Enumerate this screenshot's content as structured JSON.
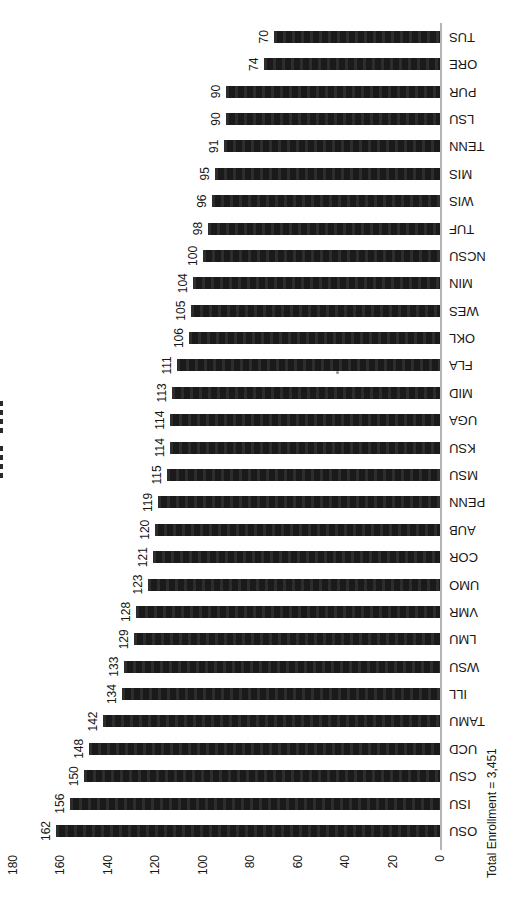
{
  "chart_data": {
    "type": "bar",
    "title": "",
    "orientation": "vertical columns; whole chart displayed rotated 90deg counter-clockwise (scanned sideways page)",
    "categories": [
      "OSU",
      "ISU",
      "CSU",
      "UCD",
      "TAMU",
      "ILL",
      "WSU",
      "LMU",
      "VMR",
      "UMO",
      "COR",
      "AUB",
      "PENN",
      "MSU",
      "KSU",
      "UGA",
      "MID",
      "FLA",
      "OKL",
      "WES",
      "MIN",
      "NCSU",
      "TUF",
      "WIS",
      "MIS",
      "TENN",
      "LSU",
      "PUR",
      "ORE",
      "TUS"
    ],
    "values": [
      162,
      156,
      150,
      148,
      142,
      134,
      133,
      129,
      128,
      123,
      121,
      120,
      119,
      115,
      114,
      114,
      113,
      111,
      106,
      105,
      104,
      100,
      98,
      96,
      95,
      91,
      90,
      90,
      74,
      70
    ],
    "xlabel": "",
    "ylabel": "",
    "ylim": [
      0,
      180
    ],
    "yticks": [
      0,
      20,
      40,
      60,
      80,
      100,
      120,
      140,
      160,
      180
    ],
    "grid": false,
    "legend": "none",
    "value_labels_shown": true,
    "footnote": "Total Enrollment = 3,451",
    "colors": {
      "bar": "#1d1d1d",
      "text": "#161616",
      "axis_line": "#b4b4b4",
      "background": "#ffffff"
    }
  }
}
